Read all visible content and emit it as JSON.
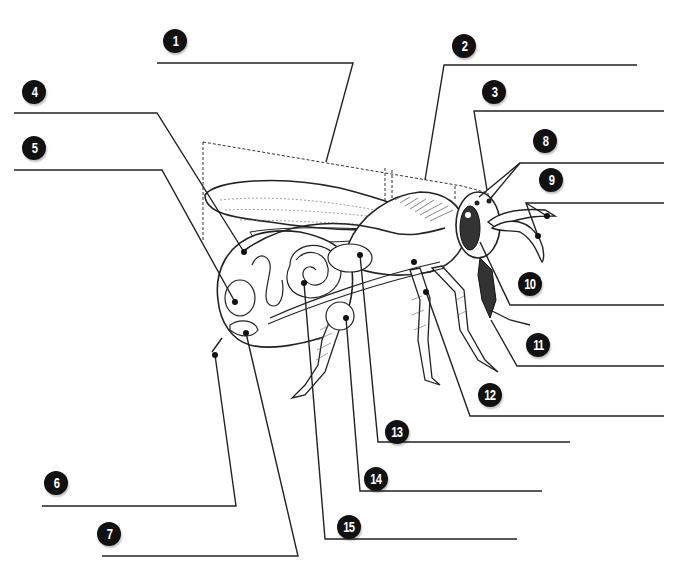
{
  "diagram": {
    "line_color": "#222222",
    "badge_color": "#111111",
    "labels": [
      {
        "number": "1",
        "badge": [
          163,
          29
        ]
      },
      {
        "number": "2",
        "badge": [
          452,
          34
        ]
      },
      {
        "number": "3",
        "badge": [
          482,
          80
        ]
      },
      {
        "number": "4",
        "badge": [
          22,
          80
        ]
      },
      {
        "number": "5",
        "badge": [
          22,
          136
        ]
      },
      {
        "number": "6",
        "badge": [
          44,
          471
        ]
      },
      {
        "number": "7",
        "badge": [
          97,
          522
        ]
      },
      {
        "number": "8",
        "badge": [
          533,
          129
        ]
      },
      {
        "number": "9",
        "badge": [
          539,
          168
        ]
      },
      {
        "number": "10",
        "badge": [
          518,
          272
        ]
      },
      {
        "number": "11",
        "badge": [
          526,
          333
        ]
      },
      {
        "number": "12",
        "badge": [
          478,
          383
        ]
      },
      {
        "number": "13",
        "badge": [
          385,
          420
        ]
      },
      {
        "number": "14",
        "badge": [
          364,
          467
        ]
      },
      {
        "number": "15",
        "badge": [
          337,
          515
        ]
      }
    ]
  }
}
